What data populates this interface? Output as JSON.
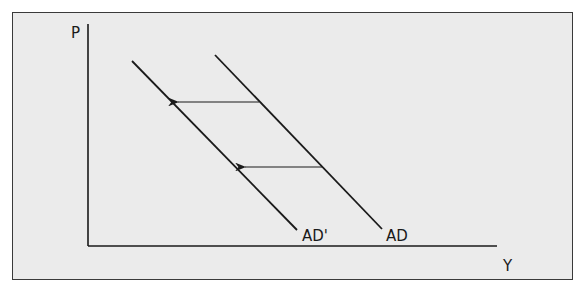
{
  "diagram": {
    "axes": {
      "y_label": "P",
      "x_label": "Y"
    },
    "curves": [
      {
        "name": "AD",
        "label": "AD"
      },
      {
        "name": "AD-prime",
        "label": "AD'"
      }
    ],
    "arrows": [
      {
        "from": "AD",
        "to": "AD'",
        "direction": "left",
        "position": "upper"
      },
      {
        "from": "AD",
        "to": "AD'",
        "direction": "left",
        "position": "lower"
      }
    ],
    "colors": {
      "background": "#ebebeb",
      "line": "#1a1a1a",
      "frame": "#3a3a3a"
    }
  }
}
